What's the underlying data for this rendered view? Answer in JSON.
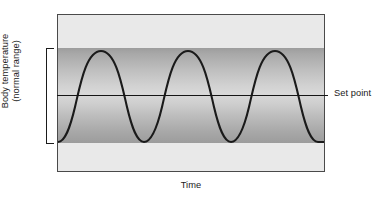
{
  "figure": {
    "name": "body-temperature-set-point-diagram",
    "background_color": "#ffffff"
  },
  "axes": {
    "y_label_line1": "Body temperature",
    "y_label_line2": "(normal range)",
    "x_label": "Time"
  },
  "annotations": {
    "set_point_label": "Set point"
  },
  "colors": {
    "plot_background": "#e9e9e9",
    "band_edge": "#9d9d9d",
    "band_center": "#d8d8d8",
    "curve": "#1a1a1a",
    "frame": "#4a4a4a",
    "text": "#1b1b1b"
  },
  "chart_data": {
    "type": "line",
    "title": "",
    "xlabel": "Time",
    "ylabel": "Body temperature (normal range)",
    "grid": false,
    "legend": null,
    "xlim": [
      0,
      268
    ],
    "ylim": [
      0,
      158
    ],
    "annotations": [
      {
        "name": "set-point-line",
        "kind": "horizontal-line",
        "y_px": 95,
        "label": "Set point"
      },
      {
        "name": "normal-range-band",
        "kind": "shaded-band",
        "y_top_px": 48,
        "y_bottom_px": 143,
        "label": "normal range"
      },
      {
        "name": "range-bracket",
        "kind": "bracket",
        "y_top_px": 48,
        "y_bottom_px": 144
      }
    ],
    "series": [
      {
        "name": "body temperature oscillation",
        "waveform": "sinusoid",
        "cycles": 3,
        "period_px": 87,
        "peak_y_px": 50,
        "trough_y_px": 141,
        "midline_y_px": 95,
        "peaks_x_px": [
          100,
          187,
          274
        ],
        "troughs_x_px": [
          57,
          144,
          231,
          318
        ],
        "path": "M 0 127 C 7 127 12 113 17 92 C 22 71 28 36 43 36 C 58 36 64 71 69 92 C 74 113 79 127 86 127 C 93 127 99 113 104 92 C 109 71 115 36 130 36 C 145 36 151 71 156 92 C 161 113 166 127 173 127 C 180 127 186 113 191 92 C 196 71 202 36 217 36 C 232 36 238 71 243 92 C 248 113 253 127 260 127 C 264 127 266 127 268 127"
      }
    ]
  }
}
